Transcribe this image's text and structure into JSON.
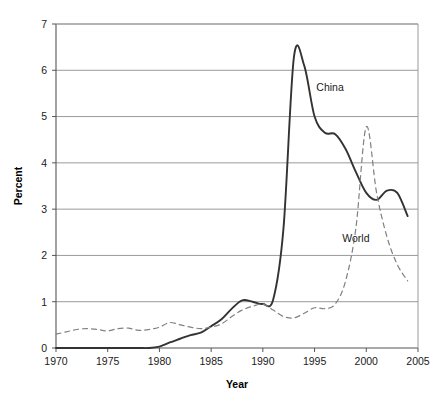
{
  "chart_data": {
    "type": "line",
    "title": "",
    "xlabel": "Year",
    "ylabel": "Percent",
    "xlim": [
      1970,
      2005
    ],
    "ylim": [
      0,
      7
    ],
    "xticks": [
      1970,
      1975,
      1980,
      1985,
      1990,
      1995,
      2000,
      2005
    ],
    "yticks": [
      0,
      1,
      2,
      3,
      4,
      5,
      6,
      7
    ],
    "grid": "horizontal",
    "legend": "inline-annotations",
    "series": [
      {
        "name": "China",
        "style": "solid",
        "color": "#333333",
        "label_position": {
          "x": 1996.5,
          "y": 5.55
        },
        "x": [
          1970,
          1971,
          1972,
          1973,
          1974,
          1975,
          1976,
          1977,
          1978,
          1979,
          1980,
          1981,
          1982,
          1983,
          1984,
          1985,
          1986,
          1987,
          1988,
          1989,
          1990,
          1991,
          1992,
          1993,
          1994,
          1995,
          1996,
          1997,
          1998,
          1999,
          2000,
          2001,
          2002,
          2003,
          2004
        ],
        "values": [
          0.0,
          0.0,
          0.0,
          0.0,
          0.0,
          0.0,
          0.0,
          0.0,
          0.0,
          0.0,
          0.03,
          0.12,
          0.2,
          0.28,
          0.33,
          0.47,
          0.62,
          0.85,
          1.03,
          1.0,
          0.95,
          1.05,
          2.6,
          6.28,
          6.1,
          5.0,
          4.65,
          4.62,
          4.3,
          3.8,
          3.35,
          3.2,
          3.4,
          3.35,
          2.85
        ]
      },
      {
        "name": "World",
        "style": "dashed",
        "color": "#808080",
        "label_position": {
          "x": 1999.0,
          "y": 2.3
        },
        "x": [
          1970,
          1971,
          1972,
          1973,
          1974,
          1975,
          1976,
          1977,
          1978,
          1979,
          1980,
          1981,
          1982,
          1983,
          1984,
          1985,
          1986,
          1987,
          1988,
          1989,
          1990,
          1991,
          1992,
          1993,
          1994,
          1995,
          1996,
          1997,
          1998,
          1999,
          2000,
          2001,
          2002,
          2003,
          2004
        ],
        "values": [
          0.3,
          0.35,
          0.4,
          0.42,
          0.4,
          0.37,
          0.42,
          0.43,
          0.38,
          0.4,
          0.45,
          0.55,
          0.5,
          0.45,
          0.42,
          0.45,
          0.52,
          0.68,
          0.82,
          0.9,
          0.95,
          0.82,
          0.68,
          0.65,
          0.75,
          0.87,
          0.85,
          0.95,
          1.45,
          2.6,
          4.78,
          3.35,
          2.4,
          1.8,
          1.45
        ]
      }
    ],
    "annotations": [
      {
        "text": "China",
        "x": 1996.5,
        "y": 5.55
      },
      {
        "text": "World",
        "x": 1999.0,
        "y": 2.3
      }
    ]
  },
  "axes": {
    "y_axis_title": "Percent",
    "x_axis_title": "Year",
    "y_tick_labels": [
      "7",
      "6",
      "5",
      "4",
      "3",
      "2",
      "1",
      "0"
    ],
    "x_tick_labels": [
      "1970",
      "1975",
      "1980",
      "1985",
      "1990",
      "1995",
      "2000",
      "2005"
    ]
  },
  "colors": {
    "china_line": "#333333",
    "world_line": "#808080",
    "gridline": "#9a9a9a",
    "axis": "#555555",
    "text": "#1a1a1a",
    "background": "#ffffff"
  }
}
